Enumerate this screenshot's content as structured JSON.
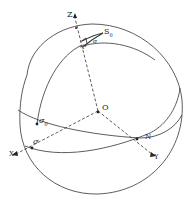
{
  "diagram": {
    "type": "celestial-sphere",
    "colors": {
      "stroke": "#333333",
      "background": "#ffffff"
    },
    "labels": {
      "z_axis": "Z",
      "x_axis": "X",
      "y_axis": "Y",
      "origin": "O",
      "s0": "S",
      "s0_sub": "0",
      "p": "P",
      "sigma_top": "σ",
      "sigma0": "σ",
      "sigma0_sub": "0",
      "sigma": "σ",
      "n": "N"
    }
  }
}
